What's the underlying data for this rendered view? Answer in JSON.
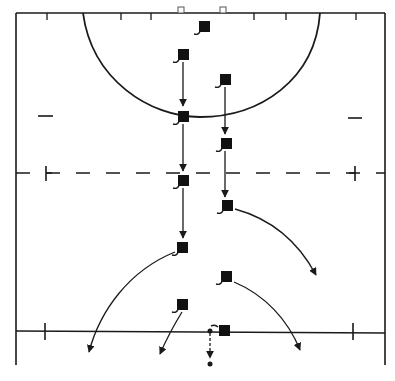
{
  "diagram": {
    "type": "lacrosse-field-play-diagram",
    "colors": {
      "line": "#1a1a1a",
      "background": "#ffffff",
      "player": "#111111"
    },
    "field": {
      "left_sideline_x": 16,
      "right_sideline_x": 385,
      "top_endline_y": 13,
      "bottom_y": 365,
      "restraining_line_y": 173,
      "midfield_line_y": 330
    },
    "goal_posts": [
      {
        "x": 181,
        "y": 10
      },
      {
        "x": 223,
        "y": 10
      }
    ],
    "players": [
      {
        "id": "p1",
        "x": 204,
        "y": 27
      },
      {
        "id": "p2",
        "x": 182,
        "y": 55
      },
      {
        "id": "p3",
        "x": 225,
        "y": 80
      },
      {
        "id": "p4",
        "x": 183,
        "y": 117
      },
      {
        "id": "p5",
        "x": 226,
        "y": 144
      },
      {
        "id": "p6",
        "x": 182,
        "y": 181
      },
      {
        "id": "p7",
        "x": 227,
        "y": 206
      },
      {
        "id": "p8",
        "x": 182,
        "y": 248
      },
      {
        "id": "p9",
        "x": 226,
        "y": 277
      },
      {
        "id": "p10",
        "x": 181,
        "y": 305
      },
      {
        "id": "p11",
        "x": 223,
        "y": 331
      }
    ],
    "ball_path": {
      "from": [
        210,
        331
      ],
      "to": [
        210,
        364
      ],
      "style": "dashed"
    }
  }
}
